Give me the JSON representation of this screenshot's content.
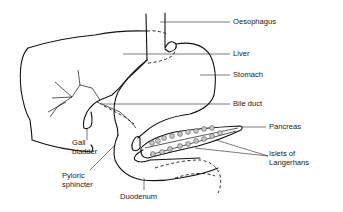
{
  "diagram": {
    "type": "anatomical-diagram",
    "labels": {
      "oesophagus": "Oesophagus",
      "liver": "Liver",
      "stomach": "Stomach",
      "bile_duct": "Bile duct",
      "pancreas": "Pancreas",
      "islets_line1": "Islets of",
      "islets_line2": "Langerhans",
      "gall_line1": "Gall",
      "gall_line2": "bladder",
      "pyloric_line1": "Pyloric",
      "pyloric_line2": "sphincter",
      "duodenum": "Duodenum"
    },
    "colors": {
      "line": "#111111",
      "background": "#ffffff",
      "islet_fill": "#c9c9c9"
    }
  }
}
